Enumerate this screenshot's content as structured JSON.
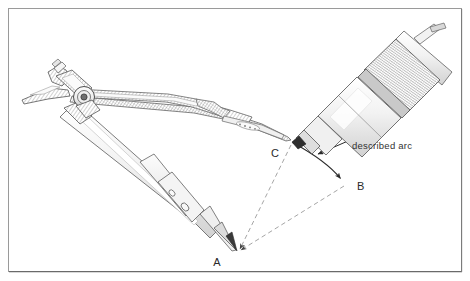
{
  "figure": {
    "background_color": "#ffffff",
    "ink_color": "#2a2a2a",
    "frame": {
      "name": "figure-border",
      "color": "#8a8a8a",
      "shadow_color": "#6e6e6e",
      "x": 8,
      "y": 8,
      "width": 454,
      "height": 264
    },
    "annotations": {
      "callout_text": "described arc",
      "callout_x": 352,
      "callout_y": 149
    },
    "points": [
      {
        "id": "point-a",
        "label": "A",
        "x": 236,
        "y": 252,
        "label_x": 218,
        "label_y": 262,
        "role": "compass needle pivot centre"
      },
      {
        "id": "point-b",
        "label": "B",
        "x": 345,
        "y": 183,
        "label_x": 355,
        "label_y": 189,
        "role": "arc end point"
      },
      {
        "id": "point-c",
        "label": "C",
        "x": 292,
        "y": 142,
        "label_x": 274,
        "label_y": 155,
        "role": "arc start point at pencil tip"
      }
    ],
    "arc": {
      "name": "described-arc",
      "from": "C",
      "to": "B",
      "centre": "A",
      "stroke": "#2a2a2a",
      "stroke_width": 1.1
    },
    "radii": [
      {
        "name": "radius-a-to-c",
        "from": "A",
        "to": "C",
        "style": "dashed"
      },
      {
        "name": "radius-a-to-b",
        "from": "A",
        "to": "B",
        "style": "dashed"
      }
    ],
    "instruments": [
      {
        "name": "compass",
        "parts": [
          "hinge-head",
          "hatched-upper-leg",
          "needle-leg",
          "needle-point",
          "adjustment-screw"
        ]
      },
      {
        "name": "mechanical-pencil",
        "parts": [
          "tip-cone",
          "barrel",
          "knurled-grip",
          "upper-body"
        ]
      }
    ]
  }
}
